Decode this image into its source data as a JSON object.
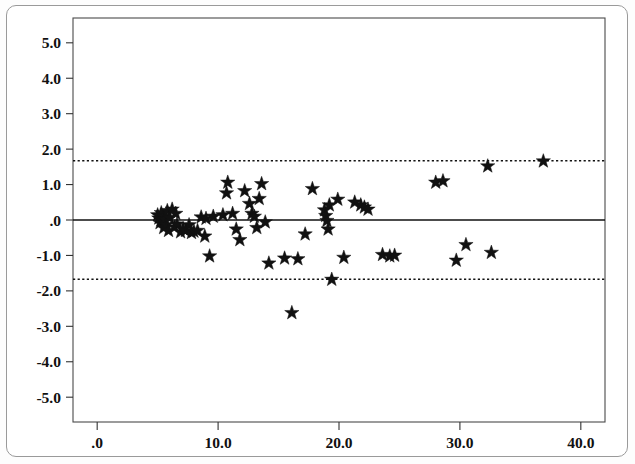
{
  "figure": {
    "kind": "scatter-plot"
  },
  "chart_data": {
    "type": "scatter",
    "title": "",
    "subtitle": "",
    "xlabel": "",
    "ylabel": "",
    "xlim": [
      -2.0,
      42.0
    ],
    "ylim": [
      -5.7,
      5.7
    ],
    "xticks": [
      0.0,
      10.0,
      20.0,
      30.0,
      40.0
    ],
    "xtick_labels": [
      ".0",
      "10.0",
      "20.0",
      "30.0",
      "40.0"
    ],
    "yticks": [
      5.0,
      4.0,
      3.0,
      2.0,
      1.0,
      0.0,
      -1.0,
      -2.0,
      -3.0,
      -4.0,
      -5.0
    ],
    "ytick_labels": [
      "5.0",
      "4.0",
      "3.0",
      "2.0",
      "1.0",
      ".0",
      "-1.0",
      "-2.0",
      "-3.0",
      "-4.0",
      "-5.0"
    ],
    "grid": false,
    "legend": null,
    "marker": "star",
    "marker_color": "#111111",
    "marker_size": 7.5,
    "reference_lines": [
      {
        "name": "mean-difference-line",
        "y": 0.0,
        "style": "solid",
        "color": "#111111",
        "width": 1.6
      },
      {
        "name": "upper-limit-of-agreement",
        "y": 1.67,
        "style": "dotted",
        "color": "#111111",
        "width": 1.5
      },
      {
        "name": "lower-limit-of-agreement",
        "y": -1.67,
        "style": "dotted",
        "color": "#111111",
        "width": 1.5
      }
    ],
    "series": [
      {
        "name": "difference-vs-mean",
        "points": [
          [
            5.0,
            0.14
          ],
          [
            5.1,
            0.05
          ],
          [
            5.2,
            -0.08
          ],
          [
            5.3,
            0.2
          ],
          [
            5.4,
            -0.02
          ],
          [
            5.5,
            0.1
          ],
          [
            5.5,
            -0.22
          ],
          [
            5.6,
            0.02
          ],
          [
            5.7,
            -0.14
          ],
          [
            5.8,
            0.26
          ],
          [
            5.9,
            -0.3
          ],
          [
            6.0,
            0.06
          ],
          [
            6.2,
            0.3
          ],
          [
            6.4,
            -0.2
          ],
          [
            6.5,
            0.18
          ],
          [
            6.6,
            -0.12
          ],
          [
            6.9,
            -0.34
          ],
          [
            7.1,
            -0.25
          ],
          [
            7.3,
            -0.3
          ],
          [
            7.6,
            -0.14
          ],
          [
            7.8,
            -0.36
          ],
          [
            8.0,
            -0.32
          ],
          [
            8.3,
            -0.3
          ],
          [
            8.6,
            0.08
          ],
          [
            8.9,
            -0.46
          ],
          [
            9.0,
            0.04
          ],
          [
            9.3,
            -1.02
          ],
          [
            9.6,
            0.1
          ],
          [
            10.4,
            0.14
          ],
          [
            10.7,
            0.76
          ],
          [
            10.8,
            1.06
          ],
          [
            11.2,
            0.18
          ],
          [
            11.5,
            -0.26
          ],
          [
            11.8,
            -0.56
          ],
          [
            12.2,
            0.82
          ],
          [
            12.6,
            0.46
          ],
          [
            12.8,
            0.18
          ],
          [
            13.0,
            0.1
          ],
          [
            13.2,
            -0.22
          ],
          [
            13.4,
            0.6
          ],
          [
            13.6,
            1.02
          ],
          [
            13.9,
            -0.06
          ],
          [
            14.2,
            -1.22
          ],
          [
            15.5,
            -1.08
          ],
          [
            16.1,
            -2.62
          ],
          [
            16.6,
            -1.1
          ],
          [
            17.2,
            -0.4
          ],
          [
            17.8,
            0.88
          ],
          [
            18.8,
            0.28
          ],
          [
            18.9,
            0.12
          ],
          [
            19.0,
            -0.02
          ],
          [
            19.1,
            -0.26
          ],
          [
            19.2,
            0.42
          ],
          [
            19.4,
            -1.68
          ],
          [
            19.9,
            0.58
          ],
          [
            20.4,
            -1.06
          ],
          [
            21.3,
            0.5
          ],
          [
            21.8,
            0.42
          ],
          [
            22.1,
            0.36
          ],
          [
            22.4,
            0.3
          ],
          [
            23.6,
            -0.98
          ],
          [
            24.2,
            -1.02
          ],
          [
            24.6,
            -1.0
          ],
          [
            28.0,
            1.06
          ],
          [
            28.6,
            1.1
          ],
          [
            29.7,
            -1.14
          ],
          [
            30.5,
            -0.7
          ],
          [
            32.3,
            1.52
          ],
          [
            32.6,
            -0.92
          ],
          [
            36.9,
            1.66
          ]
        ]
      }
    ]
  }
}
